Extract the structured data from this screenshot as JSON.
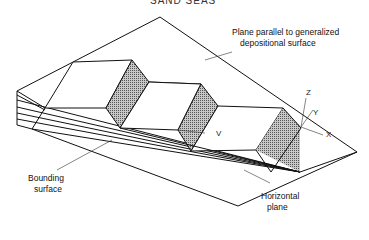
{
  "figure": {
    "title_partial": "SAND SEAS",
    "labels": {
      "plane_parallel_line1": "Plane parallel to generalized",
      "plane_parallel_line2": "depositional surface",
      "bounding_line1": "Bounding",
      "bounding_line2": "surface",
      "horizontal_line1": "Horizontal",
      "horizontal_line2": "plane"
    },
    "axes": {
      "z": "Z",
      "y": "Y",
      "x": "X",
      "v": "V"
    },
    "colors": {
      "line": "#111111",
      "shaded_face": "#9a9a9a",
      "background": "#ffffff"
    }
  }
}
